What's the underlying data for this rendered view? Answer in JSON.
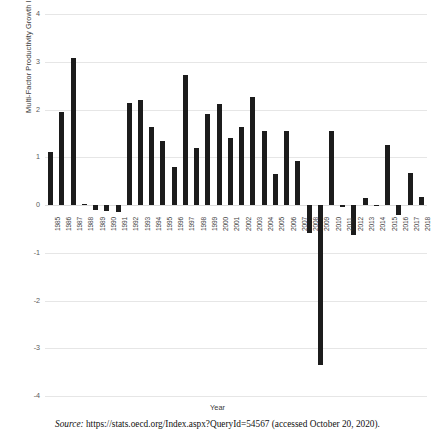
{
  "figure": {
    "source_label": "Source:",
    "source_text": "https://stats.oecd.org/Index.aspx?QueryId=54567 (accessed October 20, 2020)."
  },
  "chart_data": {
    "type": "bar",
    "title": "",
    "xlabel": "Year",
    "ylabel": "Multi-Factor Productivity Growth Index for the U.K.",
    "ylim": [
      -4,
      4
    ],
    "yticks": [
      4,
      3,
      2,
      1,
      0,
      -1,
      -2,
      -3,
      -4
    ],
    "ytick_labels": [
      "4",
      "3",
      "2",
      "1",
      "0",
      "-1",
      "-2",
      "-3",
      "-4"
    ],
    "grid": true,
    "legend": "none",
    "bar_color": "#1c1c1c",
    "categories": [
      "1985",
      "1986",
      "1987",
      "1988",
      "1989",
      "1990",
      "1991",
      "1992",
      "1993",
      "1994",
      "1995",
      "1996",
      "1997",
      "1998",
      "1999",
      "2000",
      "2001",
      "2002",
      "2003",
      "2004",
      "2005",
      "2006",
      "2007",
      "2008",
      "2009",
      "2010",
      "2011",
      "2012",
      "2013",
      "2014",
      "2015",
      "2016",
      "2017",
      "2018"
    ],
    "values": [
      1.1,
      1.95,
      3.08,
      0.02,
      -0.1,
      -0.12,
      -0.14,
      2.13,
      2.2,
      1.64,
      1.35,
      0.79,
      2.72,
      1.19,
      1.9,
      2.12,
      1.4,
      1.64,
      2.26,
      1.56,
      0.65,
      1.56,
      0.92,
      -0.58,
      -3.36,
      1.56,
      -0.04,
      -0.62,
      0.15,
      -0.02,
      1.25,
      -0.2,
      0.66,
      0.16
    ]
  }
}
